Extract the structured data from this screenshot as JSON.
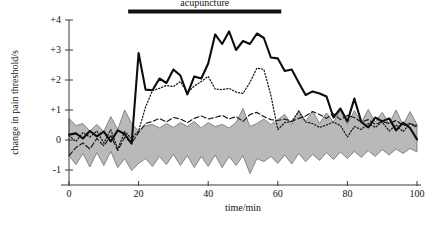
{
  "chart_data": {
    "type": "line",
    "title": "",
    "xlabel": "time/min",
    "ylabel": "change in pain threshold/s",
    "xlim": [
      0,
      100
    ],
    "ylim": [
      -1.5,
      4
    ],
    "grid": false,
    "legend_position": "none",
    "x_ticks": [
      0,
      20,
      40,
      60,
      80,
      100
    ],
    "x_tick_labels": [
      "0",
      "20",
      "40",
      "60",
      "80",
      "100"
    ],
    "y_ticks": [
      -1,
      0,
      1,
      2,
      3,
      4
    ],
    "y_tick_labels": [
      "-1",
      "0",
      "+1",
      "+2",
      "+3",
      "+4"
    ],
    "annotations": [
      {
        "name": "acupuncture-bar",
        "label": "acupuncture",
        "type": "horizontal-bar",
        "x_start": 17,
        "x_end": 61,
        "y": 4.35,
        "color": "#121212"
      }
    ],
    "x": [
      0,
      2,
      4,
      6,
      8,
      10,
      12,
      14,
      16,
      18,
      20,
      22,
      24,
      26,
      28,
      30,
      32,
      34,
      36,
      38,
      40,
      42,
      44,
      46,
      48,
      50,
      52,
      54,
      56,
      58,
      60,
      62,
      64,
      66,
      68,
      70,
      72,
      74,
      76,
      78,
      80,
      82,
      84,
      86,
      88,
      90,
      92,
      94,
      96,
      98,
      100
    ],
    "series": [
      {
        "name": "acupuncture group (mean)",
        "style": "solid",
        "color": "#0d0d0d",
        "values": [
          0.18,
          0.22,
          0.05,
          0.3,
          0.12,
          0.28,
          -0.05,
          0.32,
          0.2,
          -0.12,
          2.9,
          1.68,
          1.66,
          2.05,
          1.9,
          2.35,
          2.15,
          1.52,
          2.12,
          2.05,
          2.55,
          3.52,
          3.2,
          3.62,
          3.0,
          3.3,
          3.2,
          3.55,
          3.4,
          2.75,
          2.72,
          2.3,
          2.35,
          1.92,
          1.5,
          1.62,
          1.55,
          1.45,
          0.75,
          1.05,
          0.62,
          1.38,
          0.6,
          0.42,
          0.75,
          0.62,
          0.72,
          0.32,
          0.58,
          0.4,
          0.02
        ]
      },
      {
        "name": "electroacupuncture group (mean)",
        "style": "dotted",
        "color": "#161616",
        "values": [
          0.15,
          -0.05,
          0.25,
          0.1,
          0.3,
          -0.1,
          0.35,
          -0.3,
          0.28,
          0.05,
          0.3,
          1.1,
          1.65,
          1.72,
          1.82,
          1.78,
          1.95,
          1.58,
          1.8,
          1.95,
          2.12,
          1.7,
          1.68,
          1.72,
          1.6,
          1.55,
          1.92,
          2.4,
          2.35,
          1.5,
          0.35,
          0.58,
          0.62,
          0.95,
          0.6,
          0.55,
          0.42,
          0.5,
          0.6,
          0.48,
          0.1,
          0.45,
          0.35,
          0.55,
          0.42,
          0.6,
          0.3,
          0.5,
          0.28,
          0.55,
          0.48
        ]
      },
      {
        "name": "sham/placebo group (mean)",
        "style": "dashed",
        "color": "#161616",
        "values": [
          -0.52,
          -0.25,
          -0.1,
          -0.3,
          0.05,
          -0.2,
          0.15,
          -0.35,
          0.1,
          -0.1,
          0.25,
          0.55,
          0.62,
          0.72,
          0.6,
          0.75,
          0.7,
          0.58,
          0.72,
          0.8,
          0.7,
          0.75,
          0.82,
          0.7,
          0.78,
          0.62,
          0.85,
          0.92,
          0.78,
          0.68,
          0.65,
          0.7,
          0.62,
          0.72,
          0.8,
          0.95,
          0.85,
          0.72,
          0.88,
          0.68,
          0.82,
          0.75,
          0.6,
          0.68,
          0.52,
          0.62,
          0.55,
          0.65,
          0.48,
          0.55,
          0.42
        ]
      }
    ],
    "band": {
      "name": "control range (shaded)",
      "fill_color": "#b9b9b9",
      "edge_color": "#6e6e6e",
      "upper": [
        0.72,
        0.48,
        0.55,
        0.3,
        0.52,
        0.28,
        0.78,
        0.35,
        1.0,
        0.55,
        0.3,
        0.48,
        0.52,
        0.4,
        0.55,
        0.42,
        0.58,
        0.45,
        0.62,
        0.4,
        0.58,
        0.45,
        0.52,
        0.4,
        0.58,
        1.05,
        0.45,
        0.55,
        0.7,
        0.52,
        0.68,
        0.85,
        0.52,
        1.0,
        0.62,
        0.95,
        0.55,
        0.9,
        0.6,
        1.0,
        0.52,
        0.98,
        0.58,
        1.02,
        0.6,
        0.92,
        0.55,
        1.0,
        0.5,
        0.95,
        0.52
      ],
      "lower": [
        -0.52,
        -0.82,
        -0.45,
        -0.9,
        -0.42,
        -0.85,
        -0.38,
        -0.92,
        -0.62,
        -1.02,
        -0.78,
        -0.62,
        -0.88,
        -0.55,
        -0.82,
        -0.48,
        -0.85,
        -0.52,
        -0.92,
        -0.55,
        -0.88,
        -0.5,
        -0.92,
        -0.55,
        -0.85,
        -0.52,
        -1.12,
        -0.62,
        -0.72,
        -0.55,
        -0.78,
        -0.5,
        -0.8,
        -0.45,
        -0.72,
        -0.48,
        -0.68,
        -0.42,
        -0.65,
        -0.4,
        -0.62,
        -0.38,
        -0.58,
        -0.35,
        -0.55,
        -0.32,
        -0.5,
        -0.3,
        -0.45,
        -0.28,
        -0.4
      ]
    }
  }
}
